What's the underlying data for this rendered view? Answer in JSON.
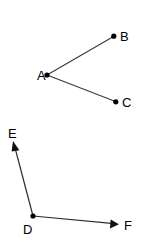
{
  "figure": {
    "background_color": "#ffffff",
    "line_color": "#3a3a3a",
    "ray_color": "#2e2e2e",
    "point_color": "#000000",
    "label_color": "#000000",
    "width": 156,
    "height": 242
  },
  "shapes": [
    {
      "name": "angle-bac",
      "kind": "angle-segments",
      "vertex": "A",
      "arms": [
        "B",
        "C"
      ],
      "description": "Angle A formed by segment AB and segment AC"
    },
    {
      "name": "angle-edf",
      "kind": "angle-rays",
      "vertex": "D",
      "arms": [
        "E",
        "F"
      ],
      "description": "Angle D formed by ray DE and ray DF"
    }
  ],
  "points": [
    {
      "label": "A",
      "x": 47,
      "y": 75,
      "dot": true,
      "label_x": 41,
      "label_y": 75
    },
    {
      "label": "B",
      "x": 114,
      "y": 36,
      "dot": true,
      "label_x": 124,
      "label_y": 36
    },
    {
      "label": "C",
      "x": 116,
      "y": 102,
      "dot": true,
      "label_x": 126,
      "label_y": 103
    },
    {
      "label": "D",
      "x": 33,
      "y": 216,
      "dot": true,
      "label_x": 27,
      "label_y": 228
    },
    {
      "label": "E",
      "x": 13,
      "y": 142,
      "dot": false,
      "label_x": 13,
      "label_y": 134
    },
    {
      "label": "F",
      "x": 118,
      "y": 224,
      "dot": false,
      "label_x": 128,
      "label_y": 226
    }
  ],
  "segments": [
    {
      "name": "segment-ab",
      "from": "A",
      "to": "B",
      "arrow": false
    },
    {
      "name": "segment-ac",
      "from": "A",
      "to": "C",
      "arrow": false
    }
  ],
  "rays": [
    {
      "name": "ray-de",
      "from": "D",
      "to": "E",
      "arrow": true
    },
    {
      "name": "ray-df",
      "from": "D",
      "to": "F",
      "arrow": true
    }
  ]
}
